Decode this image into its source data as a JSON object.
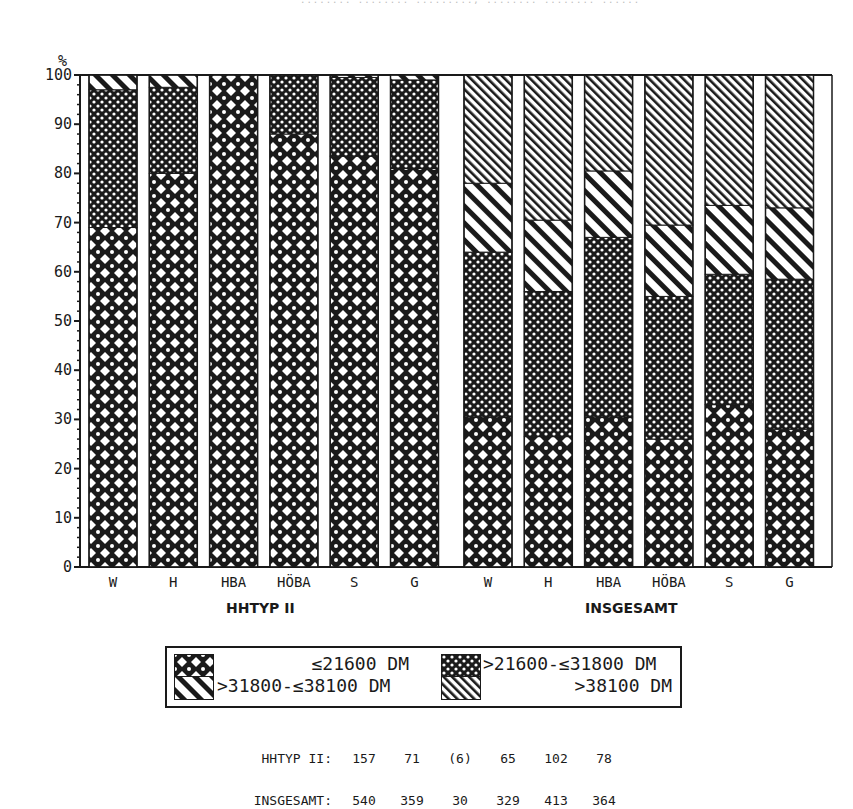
{
  "header": {
    "faint_text": "........ ........ ........., ........ ........ ......"
  },
  "axis": {
    "y_unit": "%",
    "y_ticks": [
      "0",
      "10",
      "20",
      "30",
      "40",
      "50",
      "60",
      "70",
      "80",
      "90",
      "100"
    ]
  },
  "groups": [
    {
      "label": "HHTYP II",
      "categories": [
        "W",
        "H",
        "HBA",
        "HÖBA",
        "S",
        "G"
      ]
    },
    {
      "label": "INSGESAMT",
      "categories": [
        "W",
        "H",
        "HBA",
        "HÖBA",
        "S",
        "G"
      ]
    }
  ],
  "legend": {
    "items": [
      {
        "label": "≤21600 DM",
        "pattern": "large-diamond-lattice"
      },
      {
        "label": ">21600-≤31800 DM",
        "pattern": "fine-dot-lattice"
      },
      {
        "label": ">31800-≤38100 DM",
        "pattern": "wide-diagonal-hatch"
      },
      {
        "label": ">38100 DM",
        "pattern": "fine-diagonal-hatch"
      }
    ]
  },
  "counts": {
    "rows": [
      {
        "label": "HHTYP II:",
        "values": [
          "157",
          "71",
          "(6)",
          "65",
          "102",
          "78"
        ]
      },
      {
        "label": "INSGESAMT:",
        "values": [
          "540",
          "359",
          "30",
          "329",
          "413",
          "364"
        ]
      }
    ]
  },
  "colors": {
    "ink": "#1a1a1a",
    "paper": "#ffffff"
  },
  "chart_data": {
    "type": "bar",
    "stacked": true,
    "normalized_percent": true,
    "title": "",
    "xlabel": "",
    "ylabel": "%",
    "ylim": [
      0,
      100
    ],
    "y_ticks": [
      0,
      10,
      20,
      30,
      40,
      50,
      60,
      70,
      80,
      90,
      100
    ],
    "grid": false,
    "legend_position": "bottom",
    "groups": [
      "HHTYP II",
      "INSGESAMT"
    ],
    "categories": [
      "W",
      "H",
      "HBA",
      "HÖBA",
      "S",
      "G"
    ],
    "series_names": [
      "≤21600 DM",
      ">21600-≤31800 DM",
      ">31800-≤38100 DM",
      ">38100 DM"
    ],
    "data": {
      "HHTYP II": {
        "series": [
          {
            "name": "≤21600 DM",
            "values": [
              69,
              80,
              100,
              88,
              83.5,
              81
            ]
          },
          {
            "name": ">21600-≤31800 DM",
            "values": [
              28,
              17.5,
              0,
              12,
              16,
              18
            ]
          },
          {
            "name": ">31800-≤38100 DM",
            "values": [
              3,
              2.5,
              0,
              0,
              0.5,
              1
            ]
          },
          {
            "name": ">38100 DM",
            "values": [
              0,
              0,
              0,
              0,
              0,
              0
            ]
          }
        ],
        "n": [
          "157",
          "71",
          "(6)",
          "65",
          "102",
          "78"
        ]
      },
      "INSGESAMT": {
        "series": [
          {
            "name": "≤21600 DM",
            "values": [
              30.5,
              26.5,
              30.5,
              26,
              33,
              28
            ]
          },
          {
            "name": ">21600-≤31800 DM",
            "values": [
              33.5,
              29.5,
              36.5,
              29,
              26.5,
              30.5
            ]
          },
          {
            "name": ">31800-≤38100 DM",
            "values": [
              14,
              14.5,
              13.5,
              14.5,
              14,
              14.5
            ]
          },
          {
            "name": ">38100 DM",
            "values": [
              22,
              29.5,
              19.5,
              30.5,
              26.5,
              27
            ]
          }
        ],
        "n": [
          "540",
          "359",
          "30",
          "329",
          "413",
          "364"
        ]
      }
    },
    "annotations": [
      "HHTYP II: 157 71 (6) 65 102 78",
      "INSGESAMT: 540 359 30 329 413 364"
    ]
  }
}
